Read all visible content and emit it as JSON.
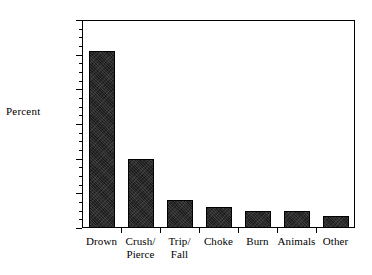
{
  "chart_data": {
    "type": "bar",
    "title": "",
    "subtitle": "",
    "xlabel": "",
    "ylabel": "Percent",
    "categories": [
      "Drown",
      "Crush/\nPierce",
      "Trip/\nFall",
      "Choke",
      "Burn",
      "Animals",
      "Other"
    ],
    "values": [
      51,
      20,
      8,
      6,
      5,
      5,
      3.5
    ],
    "ylim": [
      0,
      60
    ],
    "ytick_labels": [
      "0",
      "10",
      "20",
      "30",
      "40",
      "50",
      "60"
    ],
    "ytick_values": [
      0,
      10,
      20,
      30,
      40,
      50,
      60
    ],
    "yminor_interval": 2.5,
    "grid": false,
    "legend": false,
    "legend_position": "none",
    "bar_color": "#1c1c1c",
    "frame_color": "#000000",
    "background_color": "#ffffff"
  },
  "figure": {
    "ylabel": "Percent"
  }
}
